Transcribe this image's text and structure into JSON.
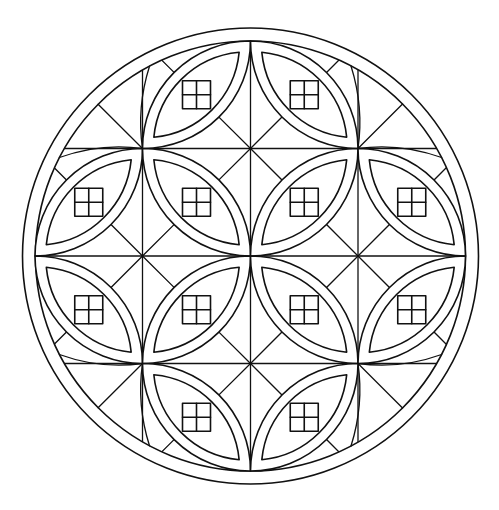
{
  "image": {
    "kind": "mandala coloring page",
    "background": "#ffffff",
    "stroke": "#111111",
    "width": 499,
    "height": 510
  },
  "mandala": {
    "center": [
      250.5,
      256
    ],
    "outer_ring_radius": 228,
    "inner_ring_radius": 215,
    "grid_step": 107.5,
    "grid_x": [
      35,
      142.5,
      250.5,
      358,
      465.5
    ],
    "grid_y": [
      41,
      148.5,
      256,
      363.5,
      471
    ],
    "petal_inset": 10,
    "window_size": 28,
    "petals": [
      {
        "cell": [
          1,
          0
        ],
        "dir": "anti"
      },
      {
        "cell": [
          2,
          0
        ],
        "dir": "diag"
      },
      {
        "cell": [
          0,
          1
        ],
        "dir": "anti"
      },
      {
        "cell": [
          1,
          1
        ],
        "dir": "diag"
      },
      {
        "cell": [
          2,
          1
        ],
        "dir": "anti"
      },
      {
        "cell": [
          3,
          1
        ],
        "dir": "diag"
      },
      {
        "cell": [
          0,
          2
        ],
        "dir": "diag"
      },
      {
        "cell": [
          1,
          2
        ],
        "dir": "anti"
      },
      {
        "cell": [
          2,
          2
        ],
        "dir": "diag"
      },
      {
        "cell": [
          3,
          2
        ],
        "dir": "anti"
      },
      {
        "cell": [
          1,
          3
        ],
        "dir": "diag"
      },
      {
        "cell": [
          2,
          3
        ],
        "dir": "anti"
      }
    ],
    "corner_cells": [
      [
        0,
        0
      ],
      [
        3,
        0
      ],
      [
        0,
        3
      ],
      [
        3,
        3
      ]
    ]
  }
}
